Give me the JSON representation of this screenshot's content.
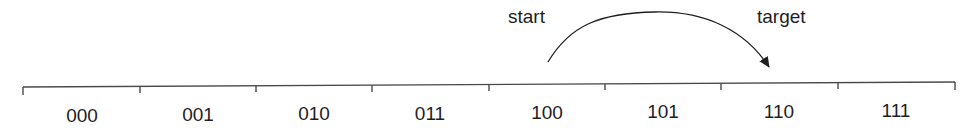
{
  "diagram": {
    "type": "number-line-jump",
    "annotations": {
      "start_label": "start",
      "target_label": "target"
    },
    "cells": [
      {
        "label": "000"
      },
      {
        "label": "001"
      },
      {
        "label": "010"
      },
      {
        "label": "011"
      },
      {
        "label": "100"
      },
      {
        "label": "101"
      },
      {
        "label": "110"
      },
      {
        "label": "111"
      }
    ],
    "arrow": {
      "from_cell": "100",
      "to_cell": "110"
    },
    "colors": {
      "line": "#4a4a4a",
      "text": "#1e1e1e",
      "background": "#ffffff"
    }
  }
}
